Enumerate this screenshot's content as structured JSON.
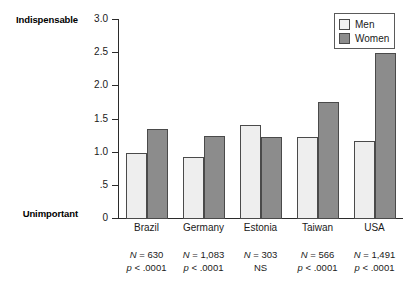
{
  "chart_data": {
    "type": "bar",
    "title": "",
    "subtitle": "",
    "xlabel": "",
    "ylabel": "",
    "grid": false,
    "legend_position": "top-right",
    "ylim": [
      0,
      3.0
    ],
    "y_axis_low_label": "Unimportant",
    "y_axis_high_label": "Indispensable",
    "y_ticks": [
      {
        "value": 3.0,
        "label": "3.0"
      },
      {
        "value": 2.5,
        "label": "2.5"
      },
      {
        "value": 2.0,
        "label": "2.0"
      },
      {
        "value": 1.5,
        "label": "1.5"
      },
      {
        "value": 1.0,
        "label": "1.0"
      },
      {
        "value": 0.5,
        "label": ".5"
      },
      {
        "value": 0.0,
        "label": "0"
      }
    ],
    "categories": [
      "Brazil",
      "Germany",
      "Estonia",
      "Taiwan",
      "USA"
    ],
    "series": [
      {
        "name": "Men",
        "color": "#eeeeee",
        "values": [
          1.0,
          0.93,
          1.42,
          1.24,
          1.18
        ]
      },
      {
        "name": "Women",
        "color": "#8c8c8c",
        "values": [
          1.35,
          1.25,
          1.24,
          1.76,
          2.51
        ]
      }
    ],
    "annotations": [
      {
        "category": "Brazil",
        "n": "N = 630",
        "p": "p < .0001"
      },
      {
        "category": "Germany",
        "n": "N = 1,083",
        "p": "p < .0001"
      },
      {
        "category": "Estonia",
        "n": "N = 303",
        "p": "NS"
      },
      {
        "category": "Taiwan",
        "n": "N = 566",
        "p": "p < .0001"
      },
      {
        "category": "USA",
        "n": "N = 1,491",
        "p": "p < .0001"
      }
    ]
  },
  "legend": {
    "items": [
      {
        "label": "Men",
        "swatch": "men-swatch"
      },
      {
        "label": "Women",
        "swatch": "women-swatch"
      }
    ]
  },
  "colors": {
    "men_fill": "#eeeeee",
    "women_fill": "#8c8c8c",
    "bar_stroke": "#4a4a4a",
    "axis": "#2b2b2b",
    "text": "#1a1a1a"
  }
}
